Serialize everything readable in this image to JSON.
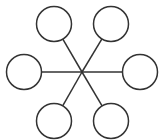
{
  "diagram": {
    "type": "hub-and-spoke",
    "width": 167,
    "height": 140,
    "stroke_color": "#333333",
    "fill_color": "#ffffff",
    "background": "#ffffff",
    "line_width": 1.5,
    "hub": {
      "x": 82,
      "y": 72
    },
    "nodes": [
      {
        "id": "top-left",
        "cx": 54,
        "cy": 24,
        "r": 17.5,
        "label": ""
      },
      {
        "id": "top-right",
        "cx": 111,
        "cy": 24,
        "r": 17.5,
        "label": ""
      },
      {
        "id": "left",
        "cx": 24,
        "cy": 72,
        "r": 17.5,
        "label": ""
      },
      {
        "id": "right",
        "cx": 140,
        "cy": 72,
        "r": 17.5,
        "label": ""
      },
      {
        "id": "bottom-left",
        "cx": 54,
        "cy": 121,
        "r": 17.5,
        "label": ""
      },
      {
        "id": "bottom-right",
        "cx": 111,
        "cy": 121,
        "r": 17.5,
        "label": ""
      }
    ]
  }
}
